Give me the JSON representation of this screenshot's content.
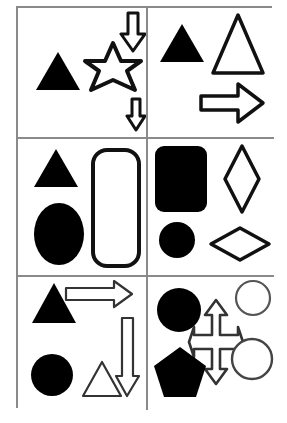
{
  "figure": {
    "grid": {
      "rows": 3,
      "columns": 2,
      "border_color": "#8a8a8a",
      "fill_color": "#000000",
      "outline_color": "#111111",
      "background": "#ffffff"
    },
    "cells": [
      {
        "id": "cell-1",
        "position": "top-left",
        "shapes": [
          {
            "name": "triangle",
            "fill": "solid",
            "size": "medium",
            "x": 16,
            "y": 42,
            "w": 48,
            "h": 42,
            "rotation": 0
          },
          {
            "name": "six-pointed-star",
            "fill": "outline",
            "size": "large",
            "x": 62,
            "y": 32,
            "w": 66,
            "h": 62,
            "rotation": 0
          },
          {
            "name": "down-arrow",
            "fill": "outline",
            "size": "medium",
            "x": 100,
            "y": 2,
            "w": 30,
            "h": 44,
            "rotation": 0
          },
          {
            "name": "down-arrow",
            "fill": "outline",
            "size": "small",
            "x": 106,
            "y": 88,
            "w": 24,
            "h": 37,
            "rotation": 0
          }
        ]
      },
      {
        "id": "cell-2",
        "position": "top-right",
        "shapes": [
          {
            "name": "triangle",
            "fill": "solid",
            "size": "medium",
            "x": 10,
            "y": 14,
            "w": 48,
            "h": 42,
            "rotation": 0
          },
          {
            "name": "triangle",
            "fill": "outline",
            "size": "large",
            "x": 64,
            "y": 4,
            "w": 54,
            "h": 62,
            "rotation": 0
          },
          {
            "name": "right-arrow",
            "fill": "outline",
            "size": "large",
            "x": 50,
            "y": 72,
            "w": 68,
            "h": 46,
            "rotation": 0
          }
        ]
      },
      {
        "id": "cell-3",
        "position": "middle-left",
        "shapes": [
          {
            "name": "triangle",
            "fill": "solid",
            "size": "medium",
            "x": 14,
            "y": 8,
            "w": 48,
            "h": 40,
            "rotation": 0
          },
          {
            "name": "ellipse",
            "fill": "solid",
            "size": "large",
            "x": 14,
            "y": 62,
            "w": 54,
            "h": 66,
            "rotation": 0
          },
          {
            "name": "rounded-rectangle",
            "fill": "outline",
            "size": "large",
            "x": 72,
            "y": 8,
            "w": 50,
            "h": 120,
            "rotation": 0
          }
        ]
      },
      {
        "id": "cell-4",
        "position": "middle-right",
        "shapes": [
          {
            "name": "rounded-square",
            "fill": "solid",
            "size": "large",
            "x": 6,
            "y": 6,
            "w": 52,
            "h": 66,
            "rotation": 0
          },
          {
            "name": "diamond-tall",
            "fill": "outline",
            "size": "large",
            "x": 74,
            "y": 4,
            "w": 38,
            "h": 70,
            "rotation": 0
          },
          {
            "name": "circle",
            "fill": "solid",
            "size": "medium",
            "x": 10,
            "y": 82,
            "w": 38,
            "h": 38,
            "rotation": 0
          },
          {
            "name": "diamond-wide",
            "fill": "outline",
            "size": "large",
            "x": 62,
            "y": 86,
            "w": 62,
            "h": 36,
            "rotation": 0
          }
        ]
      },
      {
        "id": "cell-5",
        "position": "bottom-left",
        "shapes": [
          {
            "name": "triangle",
            "fill": "solid",
            "size": "medium",
            "x": 12,
            "y": 4,
            "w": 48,
            "h": 42,
            "rotation": 0
          },
          {
            "name": "right-arrow",
            "fill": "outline",
            "size": "medium",
            "x": 46,
            "y": 4,
            "w": 68,
            "h": 28,
            "rotation": 0
          },
          {
            "name": "circle",
            "fill": "solid",
            "size": "medium",
            "x": 12,
            "y": 76,
            "w": 44,
            "h": 44,
            "rotation": 0
          },
          {
            "name": "triangle",
            "fill": "outline",
            "size": "medium",
            "x": 62,
            "y": 82,
            "w": 42,
            "h": 38,
            "rotation": 0
          },
          {
            "name": "down-arrow",
            "fill": "outline",
            "size": "long",
            "x": 96,
            "y": 38,
            "w": 26,
            "h": 82,
            "rotation": 0
          }
        ]
      },
      {
        "id": "cell-6",
        "position": "bottom-right",
        "shapes": [
          {
            "name": "circle",
            "fill": "solid",
            "size": "medium",
            "x": 8,
            "y": 10,
            "w": 44,
            "h": 44,
            "rotation": 0
          },
          {
            "name": "four-way-arrow",
            "fill": "outline",
            "size": "large",
            "x": 40,
            "y": 22,
            "w": 58,
            "h": 86,
            "rotation": 0
          },
          {
            "name": "circle",
            "fill": "outline",
            "size": "medium",
            "x": 86,
            "y": 2,
            "w": 38,
            "h": 38,
            "rotation": 0
          },
          {
            "name": "circle",
            "fill": "outline",
            "size": "medium",
            "x": 84,
            "y": 62,
            "w": 42,
            "h": 42,
            "rotation": 0
          },
          {
            "name": "pentagon",
            "fill": "solid",
            "size": "large",
            "x": 4,
            "y": 68,
            "w": 54,
            "h": 52,
            "rotation": 0
          }
        ]
      }
    ]
  }
}
